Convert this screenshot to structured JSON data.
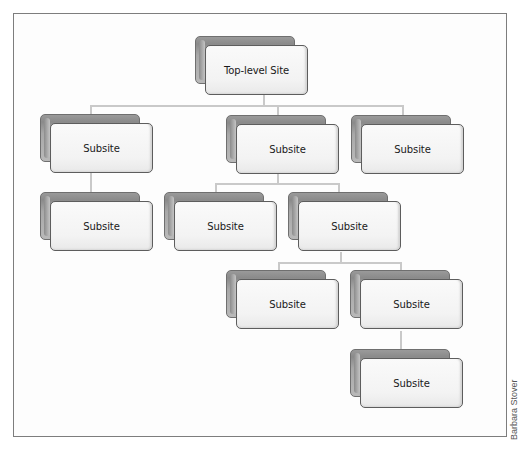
{
  "diagram": {
    "type": "site-hierarchy",
    "root": {
      "label": "Top-level Site",
      "children": [
        {
          "label": "Subsite",
          "children": [
            {
              "label": "Subsite",
              "children": []
            }
          ]
        },
        {
          "label": "Subsite",
          "children": [
            {
              "label": "Subsite",
              "children": []
            },
            {
              "label": "Subsite",
              "children": [
                {
                  "label": "Subsite",
                  "children": []
                },
                {
                  "label": "Subsite",
                  "children": [
                    {
                      "label": "Subsite",
                      "children": []
                    }
                  ]
                }
              ]
            }
          ]
        },
        {
          "label": "Subsite",
          "children": []
        }
      ]
    },
    "nodes": [
      {
        "id": "top",
        "label": "Top-level Site"
      },
      {
        "id": "l1a",
        "label": "Subsite"
      },
      {
        "id": "l1b",
        "label": "Subsite"
      },
      {
        "id": "l1c",
        "label": "Subsite"
      },
      {
        "id": "l2a",
        "label": "Subsite"
      },
      {
        "id": "l2b",
        "label": "Subsite"
      },
      {
        "id": "l2c",
        "label": "Subsite"
      },
      {
        "id": "l3a",
        "label": "Subsite"
      },
      {
        "id": "l3b",
        "label": "Subsite"
      },
      {
        "id": "l4a",
        "label": "Subsite"
      }
    ],
    "colors": {
      "card_front": "#f5f5f5",
      "card_back": "#9a9a9a",
      "card_border": "#5d5d5d",
      "connector": "#c9c9c9",
      "frame_border": "#7d7d7d"
    }
  },
  "credit": "Barbara Stover"
}
